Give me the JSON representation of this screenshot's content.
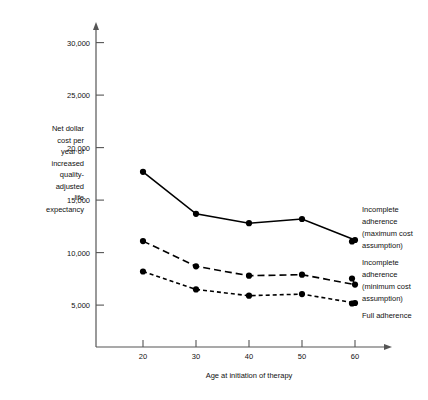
{
  "chart_data": {
    "type": "line",
    "title": "",
    "xlabel": "Age at initiation of therapy",
    "ylabel": "Net dollar cost per year of increased quality-adjusted life expectancy",
    "ylabel_lines": [
      "Net dollar",
      "cost per",
      "year of",
      "increased",
      "quality-",
      "adjusted",
      "life",
      "expectancy"
    ],
    "categories": [
      20,
      30,
      40,
      50,
      60
    ],
    "x": [
      20,
      30,
      40,
      50,
      60
    ],
    "xtick_labels": [
      "20",
      "30",
      "40",
      "50",
      "60"
    ],
    "ytick_values": [
      5000,
      10000,
      15000,
      20000,
      25000,
      30000
    ],
    "ytick_labels": [
      "5,000",
      "10,000",
      "15,000",
      "20,000",
      "25,000",
      "30,000"
    ],
    "xlim": [
      15,
      65
    ],
    "ylim": [
      0,
      31500
    ],
    "grid": false,
    "legend_position": "right-inline-annotations",
    "series": [
      {
        "name": "Incomplete adherence (maximum cost assumption)",
        "label_lines": [
          "Incomplete",
          "adherence",
          "(maximum cost",
          "assumption)"
        ],
        "style": "solid",
        "marker": "filled-circle",
        "values": [
          17700,
          13700,
          12800,
          13200,
          11200
        ]
      },
      {
        "name": "Incomplete adherence (minimum cost assumption)",
        "label_lines": [
          "Incomplete",
          "adherence",
          "(minimum cost",
          "assumption)"
        ],
        "style": "long-dashed",
        "marker": "filled-circle",
        "values": [
          11100,
          8700,
          7800,
          7900,
          6950
        ]
      },
      {
        "name": "Full adherence",
        "label_lines": [
          "Full adherence"
        ],
        "style": "short-dashed",
        "marker": "filled-circle",
        "values": [
          8200,
          6500,
          5900,
          6050,
          5200
        ]
      }
    ],
    "colors": {
      "line": "#000000",
      "axis": "#555555",
      "text": "#111111",
      "background": "#ffffff"
    }
  }
}
